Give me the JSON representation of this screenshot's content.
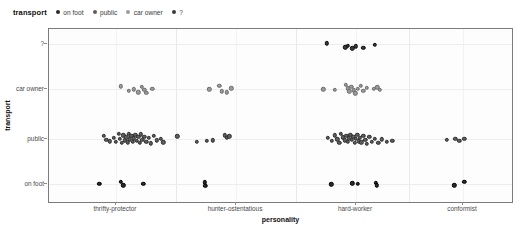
{
  "legend": {
    "title": "transport",
    "items": [
      {
        "label": "on foot",
        "color": "#2b2b2b"
      },
      {
        "label": "public",
        "color": "#5e5e5e"
      },
      {
        "label": "car owner",
        "color": "#9b9b9b"
      },
      {
        "label": "?",
        "color": "#3a3a3a"
      }
    ]
  },
  "axes": {
    "x_label": "personality",
    "y_label": "transport",
    "x_categories": [
      "thrifty-protector",
      "hunter-ostentatious",
      "hard-worker",
      "conformist"
    ],
    "y_categories": [
      "on foot",
      "public",
      "car owner",
      "?"
    ]
  },
  "chart_data": {
    "type": "scatter",
    "title": "",
    "xlabel": "personality",
    "ylabel": "transport",
    "legend_title": "transport",
    "legend_position": "top",
    "grid": true,
    "x_categories": [
      "thrifty-protector",
      "hunter-ostentatious",
      "hard-worker",
      "conformist"
    ],
    "y_categories": [
      "on foot",
      "public",
      "car owner",
      "?"
    ],
    "colors": {
      "on foot": "#2b2b2b",
      "public": "#5e5e5e",
      "car owner": "#9b9b9b",
      "?": "#3a3a3a"
    },
    "note": "Jittered categorical strip plot; each point is one observation. xj/yj are jittered pixel-fraction offsets within the panel (0-1).",
    "series": [
      {
        "name": "on foot",
        "y_category": "on foot",
        "points": [
          {
            "x": "thrifty-protector",
            "xj": 0.108,
            "yj": 0.885
          },
          {
            "x": "thrifty-protector",
            "xj": 0.155,
            "yj": 0.872
          },
          {
            "x": "thrifty-protector",
            "xj": 0.16,
            "yj": 0.893
          },
          {
            "x": "thrifty-protector",
            "xj": 0.203,
            "yj": 0.886
          },
          {
            "x": "hunter-ostentatious",
            "xj": 0.335,
            "yj": 0.876
          },
          {
            "x": "hunter-ostentatious",
            "xj": 0.336,
            "yj": 0.897
          },
          {
            "x": "hard-worker",
            "xj": 0.607,
            "yj": 0.888
          },
          {
            "x": "hard-worker",
            "xj": 0.652,
            "yj": 0.881
          },
          {
            "x": "hard-worker",
            "xj": 0.664,
            "yj": 0.886
          },
          {
            "x": "hard-worker",
            "xj": 0.703,
            "yj": 0.879
          },
          {
            "x": "hard-worker",
            "xj": 0.705,
            "yj": 0.893
          },
          {
            "x": "conformist",
            "xj": 0.872,
            "yj": 0.893
          },
          {
            "x": "conformist",
            "xj": 0.893,
            "yj": 0.872
          }
        ]
      },
      {
        "name": "public",
        "y_category": "public",
        "points": [
          {
            "x": "thrifty-protector",
            "xj": 0.118,
            "yj": 0.612
          },
          {
            "x": "thrifty-protector",
            "xj": 0.123,
            "yj": 0.634
          },
          {
            "x": "thrifty-protector",
            "xj": 0.131,
            "yj": 0.641
          },
          {
            "x": "thrifty-protector",
            "xj": 0.139,
            "yj": 0.62
          },
          {
            "x": "thrifty-protector",
            "xj": 0.144,
            "yj": 0.646
          },
          {
            "x": "thrifty-protector",
            "xj": 0.15,
            "yj": 0.6
          },
          {
            "x": "thrifty-protector",
            "xj": 0.152,
            "yj": 0.628
          },
          {
            "x": "thrifty-protector",
            "xj": 0.157,
            "yj": 0.652
          },
          {
            "x": "thrifty-protector",
            "xj": 0.16,
            "yj": 0.607
          },
          {
            "x": "thrifty-protector",
            "xj": 0.163,
            "yj": 0.637
          },
          {
            "x": "thrifty-protector",
            "xj": 0.166,
            "yj": 0.619
          },
          {
            "x": "thrifty-protector",
            "xj": 0.169,
            "yj": 0.648
          },
          {
            "x": "thrifty-protector",
            "xj": 0.171,
            "yj": 0.598
          },
          {
            "x": "thrifty-protector",
            "xj": 0.174,
            "yj": 0.631
          },
          {
            "x": "thrifty-protector",
            "xj": 0.177,
            "yj": 0.612
          },
          {
            "x": "thrifty-protector",
            "xj": 0.18,
            "yj": 0.643
          },
          {
            "x": "thrifty-protector",
            "xj": 0.183,
            "yj": 0.624
          },
          {
            "x": "thrifty-protector",
            "xj": 0.186,
            "yj": 0.605
          },
          {
            "x": "thrifty-protector",
            "xj": 0.189,
            "yj": 0.639
          },
          {
            "x": "thrifty-protector",
            "xj": 0.192,
            "yj": 0.617
          },
          {
            "x": "thrifty-protector",
            "xj": 0.195,
            "yj": 0.65
          },
          {
            "x": "thrifty-protector",
            "xj": 0.198,
            "yj": 0.602
          },
          {
            "x": "thrifty-protector",
            "xj": 0.201,
            "yj": 0.633
          },
          {
            "x": "thrifty-protector",
            "xj": 0.205,
            "yj": 0.615
          },
          {
            "x": "thrifty-protector",
            "xj": 0.209,
            "yj": 0.645
          },
          {
            "x": "thrifty-protector",
            "xj": 0.214,
            "yj": 0.622
          },
          {
            "x": "thrifty-protector",
            "xj": 0.219,
            "yj": 0.654
          },
          {
            "x": "thrifty-protector",
            "xj": 0.225,
            "yj": 0.609
          },
          {
            "x": "thrifty-protector",
            "xj": 0.232,
            "yj": 0.636
          },
          {
            "x": "thrifty-protector",
            "xj": 0.24,
            "yj": 0.626
          },
          {
            "x": "thrifty-protector",
            "xj": 0.246,
            "yj": 0.648
          },
          {
            "x": "thrifty-protector",
            "xj": 0.276,
            "yj": 0.614
          },
          {
            "x": "hunter-ostentatious",
            "xj": 0.318,
            "yj": 0.645
          },
          {
            "x": "hunter-ostentatious",
            "xj": 0.34,
            "yj": 0.64
          },
          {
            "x": "hunter-ostentatious",
            "xj": 0.352,
            "yj": 0.636
          },
          {
            "x": "hunter-ostentatious",
            "xj": 0.378,
            "yj": 0.607
          },
          {
            "x": "hunter-ostentatious",
            "xj": 0.382,
            "yj": 0.62
          },
          {
            "x": "hunter-ostentatious",
            "xj": 0.388,
            "yj": 0.613
          },
          {
            "x": "hard-worker",
            "xj": 0.6,
            "yj": 0.622
          },
          {
            "x": "hard-worker",
            "xj": 0.608,
            "yj": 0.64
          },
          {
            "x": "hard-worker",
            "xj": 0.614,
            "yj": 0.608
          },
          {
            "x": "hard-worker",
            "xj": 0.62,
            "yj": 0.63
          },
          {
            "x": "hard-worker",
            "xj": 0.624,
            "yj": 0.652
          },
          {
            "x": "hard-worker",
            "xj": 0.628,
            "yj": 0.6
          },
          {
            "x": "hard-worker",
            "xj": 0.632,
            "yj": 0.618
          },
          {
            "x": "hard-worker",
            "xj": 0.636,
            "yj": 0.636
          },
          {
            "x": "hard-worker",
            "xj": 0.639,
            "yj": 0.611
          },
          {
            "x": "hard-worker",
            "xj": 0.642,
            "yj": 0.646
          },
          {
            "x": "hard-worker",
            "xj": 0.645,
            "yj": 0.625
          },
          {
            "x": "hard-worker",
            "xj": 0.648,
            "yj": 0.604
          },
          {
            "x": "hard-worker",
            "xj": 0.651,
            "yj": 0.633
          },
          {
            "x": "hard-worker",
            "xj": 0.654,
            "yj": 0.615
          },
          {
            "x": "hard-worker",
            "xj": 0.657,
            "yj": 0.65
          },
          {
            "x": "hard-worker",
            "xj": 0.66,
            "yj": 0.628
          },
          {
            "x": "hard-worker",
            "xj": 0.663,
            "yj": 0.606
          },
          {
            "x": "hard-worker",
            "xj": 0.666,
            "yj": 0.641
          },
          {
            "x": "hard-worker",
            "xj": 0.669,
            "yj": 0.62
          },
          {
            "x": "hard-worker",
            "xj": 0.672,
            "yj": 0.648
          },
          {
            "x": "hard-worker",
            "xj": 0.676,
            "yj": 0.612
          },
          {
            "x": "hard-worker",
            "xj": 0.68,
            "yj": 0.634
          },
          {
            "x": "hard-worker",
            "xj": 0.684,
            "yj": 0.656
          },
          {
            "x": "hard-worker",
            "xj": 0.689,
            "yj": 0.617
          },
          {
            "x": "hard-worker",
            "xj": 0.694,
            "yj": 0.643
          },
          {
            "x": "hard-worker",
            "xj": 0.7,
            "yj": 0.626
          },
          {
            "x": "hard-worker",
            "xj": 0.708,
            "yj": 0.65
          },
          {
            "x": "hard-worker",
            "xj": 0.716,
            "yj": 0.631
          },
          {
            "x": "hard-worker",
            "xj": 0.726,
            "yj": 0.646
          },
          {
            "x": "hard-worker",
            "xj": 0.738,
            "yj": 0.639
          },
          {
            "x": "conformist",
            "xj": 0.855,
            "yj": 0.634
          },
          {
            "x": "conformist",
            "xj": 0.874,
            "yj": 0.626
          },
          {
            "x": "conformist",
            "xj": 0.882,
            "yj": 0.638
          },
          {
            "x": "conformist",
            "xj": 0.893,
            "yj": 0.628
          }
        ]
      },
      {
        "name": "car owner",
        "y_category": "car owner",
        "points": [
          {
            "x": "thrifty-protector",
            "xj": 0.155,
            "yj": 0.327
          },
          {
            "x": "thrifty-protector",
            "xj": 0.172,
            "yj": 0.352
          },
          {
            "x": "thrifty-protector",
            "xj": 0.183,
            "yj": 0.345
          },
          {
            "x": "thrifty-protector",
            "xj": 0.192,
            "yj": 0.362
          },
          {
            "x": "thrifty-protector",
            "xj": 0.2,
            "yj": 0.33
          },
          {
            "x": "thrifty-protector",
            "xj": 0.205,
            "yj": 0.349
          },
          {
            "x": "thrifty-protector",
            "xj": 0.209,
            "yj": 0.366
          },
          {
            "x": "thrifty-protector",
            "xj": 0.222,
            "yj": 0.341
          },
          {
            "x": "hunter-ostentatious",
            "xj": 0.345,
            "yj": 0.344
          },
          {
            "x": "hunter-ostentatious",
            "xj": 0.366,
            "yj": 0.325
          },
          {
            "x": "hunter-ostentatious",
            "xj": 0.371,
            "yj": 0.355
          },
          {
            "x": "hunter-ostentatious",
            "xj": 0.382,
            "yj": 0.362
          },
          {
            "x": "hunter-ostentatious",
            "xj": 0.392,
            "yj": 0.338
          },
          {
            "x": "hard-worker",
            "xj": 0.59,
            "yj": 0.344
          },
          {
            "x": "hard-worker",
            "xj": 0.615,
            "yj": 0.346
          },
          {
            "x": "hard-worker",
            "xj": 0.638,
            "yj": 0.32
          },
          {
            "x": "hard-worker",
            "xj": 0.642,
            "yj": 0.338
          },
          {
            "x": "hard-worker",
            "xj": 0.646,
            "yj": 0.356
          },
          {
            "x": "hard-worker",
            "xj": 0.65,
            "yj": 0.332
          },
          {
            "x": "hard-worker",
            "xj": 0.655,
            "yj": 0.35
          },
          {
            "x": "hard-worker",
            "xj": 0.659,
            "yj": 0.368
          },
          {
            "x": "hard-worker",
            "xj": 0.664,
            "yj": 0.34
          },
          {
            "x": "hard-worker",
            "xj": 0.67,
            "yj": 0.326
          },
          {
            "x": "hard-worker",
            "xj": 0.676,
            "yj": 0.352
          },
          {
            "x": "hard-worker",
            "xj": 0.684,
            "yj": 0.336
          },
          {
            "x": "hard-worker",
            "xj": 0.699,
            "yj": 0.341
          },
          {
            "x": "hard-worker",
            "xj": 0.706,
            "yj": 0.333
          },
          {
            "x": "hard-worker",
            "xj": 0.712,
            "yj": 0.348
          }
        ]
      },
      {
        "name": "?",
        "y_category": "?",
        "points": [
          {
            "x": "hard-worker",
            "xj": 0.597,
            "yj": 0.082
          },
          {
            "x": "hard-worker",
            "xj": 0.637,
            "yj": 0.105
          },
          {
            "x": "hard-worker",
            "xj": 0.643,
            "yj": 0.095
          },
          {
            "x": "hard-worker",
            "xj": 0.652,
            "yj": 0.11
          },
          {
            "x": "hard-worker",
            "xj": 0.66,
            "yj": 0.099
          },
          {
            "x": "hard-worker",
            "xj": 0.676,
            "yj": 0.107
          },
          {
            "x": "hard-worker",
            "xj": 0.7,
            "yj": 0.09
          }
        ]
      }
    ]
  },
  "geometry": {
    "y_tick_frac": {
      "?": 0.0857,
      "car owner": 0.3428,
      "public": 0.6285,
      "on foot": 0.8857
    },
    "x_tick_frac": [
      0.1441,
      0.4022,
      0.6602,
      0.8903
    ],
    "panel_sep_frac": [
      0.2731,
      0.5312,
      0.7752
    ]
  }
}
